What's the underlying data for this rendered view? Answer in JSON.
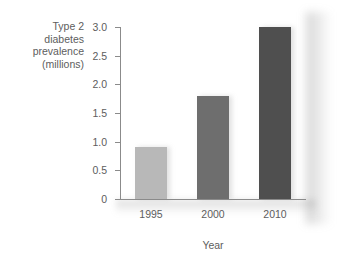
{
  "chart_data": {
    "type": "bar",
    "title": "",
    "subtitle": "",
    "categories": [
      "1995",
      "2000",
      "2010"
    ],
    "values": [
      0.9,
      1.8,
      3.0
    ],
    "series": [
      {
        "name": "Type 2 diabetes prevalence",
        "values": [
          0.9,
          1.8,
          3.0
        ]
      }
    ],
    "bar_colors": [
      "#b8b8b8",
      "#6e6e6e",
      "#4f4f4f"
    ],
    "xlabel": "Year",
    "ylabel_lines": [
      "Type 2",
      "diabetes",
      "prevalence",
      "(millions)"
    ],
    "ylabel": "Type 2 diabetes prevalence (millions)",
    "ylim": [
      0,
      3.0
    ],
    "ytick_labels": [
      "0",
      "0.5",
      "1.0",
      "1.5",
      "2.0",
      "2.5",
      "3.0"
    ],
    "ytick_values": [
      0,
      0.5,
      1.0,
      1.5,
      2.0,
      2.5,
      3.0
    ],
    "xtick_labels": [
      "1995",
      "2000",
      "2010"
    ],
    "grid": false,
    "legend": "none",
    "background_color": "#ffffff",
    "axis_color": "#8b8b8b",
    "text_color": "#5d5d5d"
  }
}
